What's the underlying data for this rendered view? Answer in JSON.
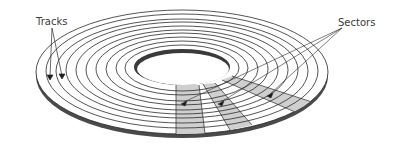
{
  "diagram": {
    "labels": {
      "tracks": "Tracks",
      "sectors": "Sectors"
    },
    "disk": {
      "center": [
        182,
        72
      ],
      "outer_rx": 146,
      "outer_ry": 62,
      "thickness": 5,
      "hole_rx": 48,
      "hole_ry": 18,
      "track_count": 10
    },
    "sectors_shaded": 3,
    "colors": {
      "line": "#2a2a2a",
      "edge": "#4a4a4a",
      "sector_fill": "#cfcfcf",
      "text": "#3a3a3a",
      "background": "#ffffff"
    }
  }
}
